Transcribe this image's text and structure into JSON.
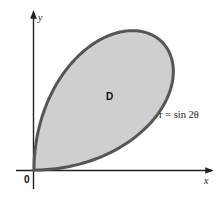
{
  "figure": {
    "region_label": "D",
    "curve_label": "r = sin 2θ",
    "origin_label": "0",
    "x_axis_label": "x",
    "y_axis_label": "y",
    "curve": {
      "equation": "r = sin(2θ)",
      "theta_range_degrees": [
        0,
        90
      ]
    },
    "colors": {
      "fill": "#cfcfcf",
      "curve_stroke": "#555555",
      "axis": "#222222",
      "background": "#ffffff"
    }
  }
}
